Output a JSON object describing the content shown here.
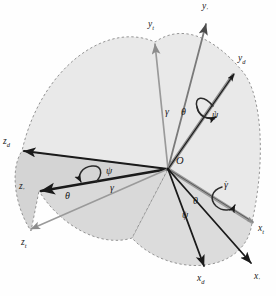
{
  "figure": {
    "origin_label": "O",
    "background": "#fefefe"
  },
  "colors": {
    "fill_light": "#e8e8e8",
    "fill_mid": "#dcdcdc",
    "fill_dark": "#cfcfcf",
    "dashed_arc": "#8a8a8a",
    "axis_dark": "#1a1a1a",
    "axis_gray": "#8c8c8c",
    "axis_midgray": "#6e6e6e",
    "text": "#1a1a1a"
  },
  "origin": {
    "x": 168,
    "y": 169
  },
  "axes": [
    {
      "name": "y-t",
      "label": "y",
      "sub": "t",
      "lx": 150,
      "ly": 24,
      "tipx": 155,
      "tipy": 42,
      "color": "#8c8c8c",
      "width": 1.6
    },
    {
      "name": "y-prime",
      "label": "y",
      "sub": "'",
      "lx": 204,
      "ly": 6,
      "tipx": 206,
      "tipy": 22,
      "color": "#6e6e6e",
      "width": 1.7
    },
    {
      "name": "y-d",
      "label": "y",
      "sub": "d",
      "lx": 240,
      "ly": 58,
      "tipx": 233,
      "tipy": 73,
      "color": "#3a3a3a",
      "width": 2.0
    },
    {
      "name": "z-d",
      "label": "z",
      "sub": "d",
      "lx": 4,
      "ly": 140,
      "tipx": 22,
      "tipy": 151,
      "color": "#1a1a1a",
      "width": 2.0
    },
    {
      "name": "z-prime",
      "label": "z",
      "sub": "'",
      "lx": 20,
      "ly": 185,
      "tipx": 39,
      "tipy": 191,
      "color": "#1a1a1a",
      "width": 2.2
    },
    {
      "name": "z-t",
      "label": "z",
      "sub": "t",
      "lx": 22,
      "ly": 243,
      "tipx": 30,
      "tipy": 231,
      "color": "#8c8c8c",
      "width": 1.6
    },
    {
      "name": "x-t",
      "label": "x",
      "sub": "t",
      "lx": 260,
      "ly": 228,
      "tipx": 252,
      "tipy": 222,
      "color": "#8c8c8c",
      "width": 2.4
    },
    {
      "name": "x-d",
      "label": "x",
      "sub": "d",
      "lx": 199,
      "ly": 278,
      "tipx": 203,
      "tipy": 264,
      "color": "#1a1a1a",
      "width": 1.9
    },
    {
      "name": "x-prime",
      "label": "x",
      "sub": "'",
      "lx": 256,
      "ly": 276,
      "tipx": 252,
      "tipy": 262,
      "color": "#1a1a1a",
      "width": 1.9
    }
  ],
  "angle_labels": [
    {
      "name": "gamma-upper",
      "text": "γ",
      "dot": false,
      "x": 165,
      "y": 107
    },
    {
      "name": "theta-upper",
      "text": "θ",
      "dot": false,
      "x": 181,
      "y": 107
    },
    {
      "name": "psi-dot-right",
      "text": "ψ",
      "dot": true,
      "x": 212,
      "y": 110
    },
    {
      "name": "psi-left",
      "text": "ψ",
      "dot": false,
      "x": 106,
      "y": 166
    },
    {
      "name": "gamma-left",
      "text": "γ",
      "dot": false,
      "x": 110,
      "y": 183
    },
    {
      "name": "theta-dot-left",
      "text": "θ",
      "dot": true,
      "x": 65,
      "y": 191
    },
    {
      "name": "gamma-dot-right",
      "text": "γ",
      "dot": true,
      "x": 224,
      "y": 180
    },
    {
      "name": "theta-lower",
      "text": "θ",
      "dot": false,
      "x": 193,
      "y": 196
    },
    {
      "name": "psi-lower",
      "text": "ψ",
      "dot": false,
      "x": 182,
      "y": 210
    }
  ],
  "rotation_arrows": [
    {
      "name": "spin-arrow-psi-dot",
      "about": "y-d axis"
    },
    {
      "name": "spin-arrow-theta-dot",
      "about": "z-prime axis"
    },
    {
      "name": "spin-arrow-gamma-dot",
      "about": "x-t axis"
    }
  ]
}
